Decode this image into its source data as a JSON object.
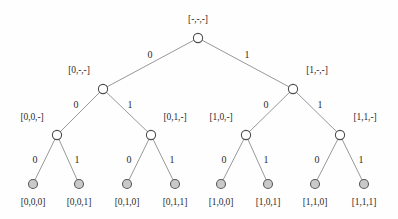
{
  "figure": {
    "background_color": "#fefefe",
    "edge_color": "#8c8c8c",
    "internal_node_fill": "#ffffff",
    "leaf_node_fill": "#c9c9c9",
    "text_color": "#2b2b2b"
  },
  "nodes": {
    "root": {
      "label": "[-,-,-]",
      "x": 198,
      "y": 38,
      "label_x": 198,
      "label_y": 20,
      "kind": "internal"
    },
    "l1_0": {
      "label": "[0,-,-]",
      "x": 103,
      "y": 89,
      "label_x": 79,
      "label_y": 71,
      "kind": "internal"
    },
    "l1_1": {
      "label": "[1,-,-]",
      "x": 293,
      "y": 89,
      "label_x": 317,
      "label_y": 71,
      "kind": "internal"
    },
    "l2_00": {
      "label": "[0,0,-]",
      "x": 57,
      "y": 135,
      "label_x": 32,
      "label_y": 118,
      "kind": "internal"
    },
    "l2_01": {
      "label": "[0,1,-]",
      "x": 151,
      "y": 135,
      "label_x": 175,
      "label_y": 118,
      "kind": "internal"
    },
    "l2_10": {
      "label": "[1,0,-]",
      "x": 246,
      "y": 135,
      "label_x": 221,
      "label_y": 118,
      "kind": "internal"
    },
    "l2_11": {
      "label": "[1,1,-]",
      "x": 340,
      "y": 135,
      "label_x": 365,
      "label_y": 118,
      "kind": "internal"
    },
    "leaf_000": {
      "label": "[0,0,0]",
      "x": 33,
      "y": 184,
      "label_x": 33,
      "label_y": 203,
      "kind": "leaf"
    },
    "leaf_001": {
      "label": "[0,0,1]",
      "x": 79,
      "y": 184,
      "label_x": 79,
      "label_y": 203,
      "kind": "leaf"
    },
    "leaf_010": {
      "label": "[0,1,0]",
      "x": 127,
      "y": 184,
      "label_x": 127,
      "label_y": 203,
      "kind": "leaf"
    },
    "leaf_011": {
      "label": "[0,1,1]",
      "x": 175,
      "y": 184,
      "label_x": 175,
      "label_y": 203,
      "kind": "leaf"
    },
    "leaf_100": {
      "label": "[1,0,0]",
      "x": 221,
      "y": 184,
      "label_x": 221,
      "label_y": 203,
      "kind": "leaf"
    },
    "leaf_101": {
      "label": "[1,0,1]",
      "x": 268,
      "y": 184,
      "label_x": 268,
      "label_y": 203,
      "kind": "leaf"
    },
    "leaf_110": {
      "label": "[1,1,0]",
      "x": 315,
      "y": 184,
      "label_x": 315,
      "label_y": 203,
      "kind": "leaf"
    },
    "leaf_111": {
      "label": "[1,1,1]",
      "x": 364,
      "y": 184,
      "label_x": 364,
      "label_y": 203,
      "kind": "leaf"
    }
  },
  "edges": [
    {
      "id": "root-l1_0",
      "from": "root",
      "to": "l1_0",
      "label": "0",
      "label_x": 150,
      "label_y": 55
    },
    {
      "id": "root-l1_1",
      "from": "root",
      "to": "l1_1",
      "label": "1",
      "label_x": 247,
      "label_y": 55
    },
    {
      "id": "l1_0-l2_00",
      "from": "l1_0",
      "to": "l2_00",
      "label": "0",
      "label_x": 76,
      "label_y": 105
    },
    {
      "id": "l1_0-l2_01",
      "from": "l1_0",
      "to": "l2_01",
      "label": "1",
      "label_x": 130,
      "label_y": 105
    },
    {
      "id": "l1_1-l2_10",
      "from": "l1_1",
      "to": "l2_10",
      "label": "0",
      "label_x": 266,
      "label_y": 105
    },
    {
      "id": "l1_1-l2_11",
      "from": "l1_1",
      "to": "l2_11",
      "label": "1",
      "label_x": 320,
      "label_y": 105
    },
    {
      "id": "l2_00-leaf_000",
      "from": "l2_00",
      "to": "leaf_000",
      "label": "0",
      "label_x": 35,
      "label_y": 160
    },
    {
      "id": "l2_00-leaf_001",
      "from": "l2_00",
      "to": "leaf_001",
      "label": "1",
      "label_x": 77,
      "label_y": 160
    },
    {
      "id": "l2_01-leaf_010",
      "from": "l2_01",
      "to": "leaf_010",
      "label": "0",
      "label_x": 129,
      "label_y": 160
    },
    {
      "id": "l2_01-leaf_011",
      "from": "l2_01",
      "to": "leaf_011",
      "label": "1",
      "label_x": 172,
      "label_y": 160
    },
    {
      "id": "l2_10-leaf_100",
      "from": "l2_10",
      "to": "leaf_100",
      "label": "0",
      "label_x": 224,
      "label_y": 160
    },
    {
      "id": "l2_10-leaf_101",
      "from": "l2_10",
      "to": "leaf_101",
      "label": "1",
      "label_x": 266,
      "label_y": 160
    },
    {
      "id": "l2_11-leaf_110",
      "from": "l2_11",
      "to": "leaf_110",
      "label": "0",
      "label_x": 317,
      "label_y": 160
    },
    {
      "id": "l2_11-leaf_111",
      "from": "l2_11",
      "to": "leaf_111",
      "label": "1",
      "label_x": 361,
      "label_y": 160
    }
  ]
}
